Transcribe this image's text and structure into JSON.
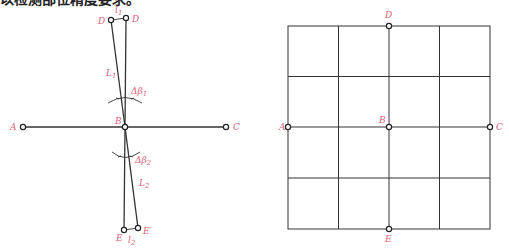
{
  "caption": "以检测部位精度要求。",
  "colors": {
    "label": "#e0607a",
    "line": "#333333",
    "background": "#ffffff"
  },
  "left_figure": {
    "points": {
      "A": "A",
      "B": "B",
      "C": "C",
      "D": "D",
      "D_prime": "D′",
      "E": "E",
      "E_prime": "E′"
    },
    "segments": {
      "L1": "L",
      "L1_sub": "1",
      "L2": "L",
      "L2_sub": "2",
      "l1": "l",
      "l1_sub": "1",
      "l2": "l",
      "l2_sub": "2"
    },
    "angles": {
      "beta1": "Δβ",
      "beta1_sub": "1",
      "beta2": "Δβ",
      "beta2_sub": "2"
    }
  },
  "right_figure": {
    "grid": {
      "columns": 4,
      "rows": 4
    },
    "points": {
      "A": "A",
      "B": "B",
      "C": "C",
      "D": "D",
      "E": "E"
    }
  }
}
